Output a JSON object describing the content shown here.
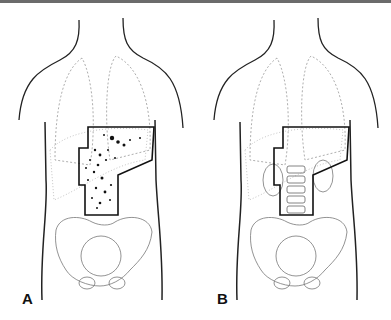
{
  "figure": {
    "panels": [
      {
        "id": "A",
        "label": "A",
        "description": "Torso outline with lungs, liver, stomach, pelvis; bold field outline containing scattered dot markings"
      },
      {
        "id": "B",
        "label": "B",
        "description": "Torso outline with lungs, liver, kidneys, vertebral column, pelvis; bold field outline"
      }
    ],
    "colors": {
      "outline": "#1a1a1a",
      "organs": "#9a9a9a",
      "field": "#111111",
      "background": "#ffffff"
    }
  }
}
